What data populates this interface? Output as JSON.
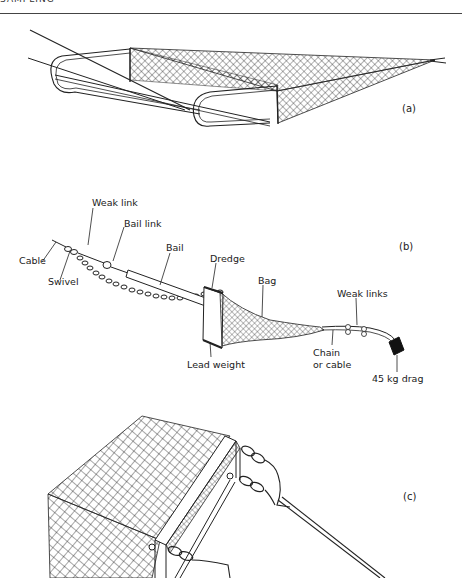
{
  "header": {
    "running_title": "SAMPLING"
  },
  "panels": [
    {
      "id": "a",
      "label": "(a)",
      "description": "Sledge-mounted net with runners"
    },
    {
      "id": "b",
      "label": "(b)",
      "description": "Dredge assembly with labelled parts"
    },
    {
      "id": "c",
      "label": "(c)",
      "description": "Close-up of dredge frame with net bag"
    }
  ],
  "labels_b": {
    "weak_link": "Weak link",
    "bail_link": "Bail link",
    "bail": "Bail",
    "cable": "Cable",
    "swivel": "Swivel",
    "dredge": "Dredge",
    "bag": "Bag",
    "weak_links": "Weak links",
    "chain_or_cable_1": "Chain",
    "chain_or_cable_2": "or cable",
    "lead_weight": "Lead weight",
    "drag": "45 kg drag"
  }
}
